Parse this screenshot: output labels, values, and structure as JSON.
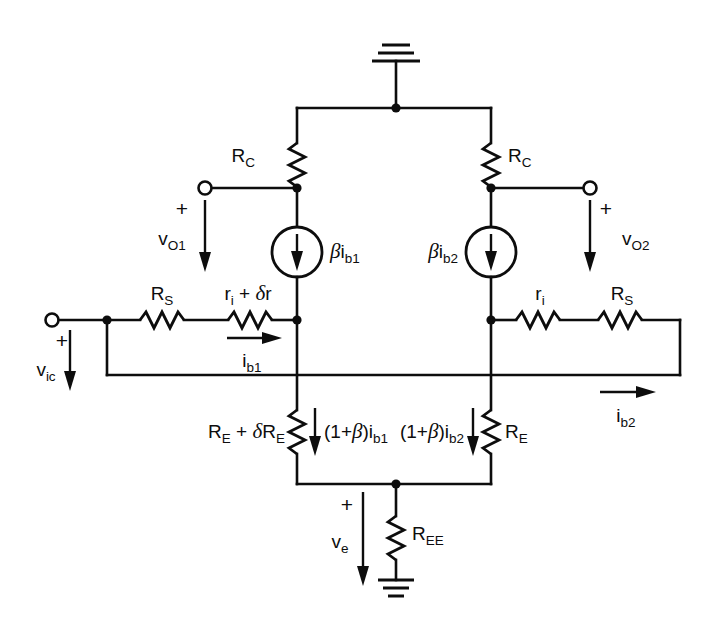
{
  "diagram": {
    "stroke_color": "#0d0d0d",
    "background_color": "#ffffff"
  },
  "labels": {
    "rc_left": "R",
    "rc_left_sub": "C",
    "rc_right": "R",
    "rc_right_sub": "C",
    "rs_left": "R",
    "rs_left_sub": "S",
    "rs_right": "R",
    "rs_right_sub": "S",
    "ri_left_main": "r",
    "ri_left_sub": "i",
    "ri_left_delta": " + ",
    "ri_left_delta_sym": "δ",
    "ri_left_delta_r": "r",
    "ri_right_main": "r",
    "ri_right_sub": "i",
    "re_left_r1": "R",
    "re_left_sub1": "E",
    "re_left_plus": " + ",
    "re_left_delta": "δ",
    "re_left_r2": "R",
    "re_left_sub2": "E",
    "re_right": "R",
    "re_right_sub": "E",
    "ree": "R",
    "ree_sub": "EE",
    "src_left_beta": "β",
    "src_left_i": "i",
    "src_left_sub": "b1",
    "src_right_beta": "β",
    "src_right_i": "i",
    "src_right_sub": "b2",
    "vo1": "v",
    "vo1_sub": "O1",
    "vo2": "v",
    "vo2_sub": "O2",
    "vic": "v",
    "vic_sub": "ic",
    "ve": "v",
    "ve_sub": "e",
    "ib1": "i",
    "ib1_sub": "b1",
    "ib2": "i",
    "ib2_sub": "b2",
    "ie1_open": "(1+",
    "ie1_beta": "β",
    "ie1_close": ")i",
    "ie1_sub": "b1",
    "ie2_open": "(1+",
    "ie2_beta": "β",
    "ie2_close": ")i",
    "ie2_sub": "b2",
    "plus_vo1": "+",
    "plus_vo2": "+",
    "plus_vic": "+",
    "plus_ve": "+"
  },
  "components": [
    {
      "name": "resistor-rc-left",
      "label": "R_C",
      "kind": "resistor"
    },
    {
      "name": "resistor-rc-right",
      "label": "R_C",
      "kind": "resistor"
    },
    {
      "name": "resistor-rs-left",
      "label": "R_S",
      "kind": "resistor"
    },
    {
      "name": "resistor-rs-right",
      "label": "R_S",
      "kind": "resistor"
    },
    {
      "name": "resistor-ri-left",
      "label": "r_i + δr",
      "kind": "resistor"
    },
    {
      "name": "resistor-ri-right",
      "label": "r_i",
      "kind": "resistor"
    },
    {
      "name": "resistor-re-left",
      "label": "R_E + δR_E",
      "kind": "resistor"
    },
    {
      "name": "resistor-re-right",
      "label": "R_E",
      "kind": "resistor"
    },
    {
      "name": "resistor-ree",
      "label": "R_EE",
      "kind": "resistor"
    },
    {
      "name": "current-source-left",
      "label": "βi_b1",
      "kind": "current-source"
    },
    {
      "name": "current-source-right",
      "label": "βi_b2",
      "kind": "current-source"
    },
    {
      "name": "ground-top",
      "label": "",
      "kind": "ground"
    },
    {
      "name": "ground-bottom",
      "label": "",
      "kind": "ground"
    },
    {
      "name": "terminal-vo1",
      "label": "v_O1",
      "kind": "open-terminal"
    },
    {
      "name": "terminal-vo2",
      "label": "v_O2",
      "kind": "open-terminal"
    },
    {
      "name": "terminal-vic",
      "label": "v_ic",
      "kind": "open-terminal"
    }
  ]
}
